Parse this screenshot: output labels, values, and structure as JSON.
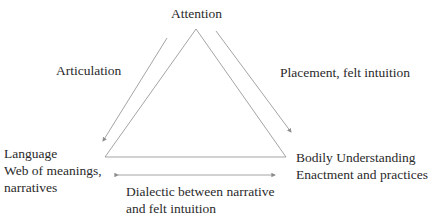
{
  "diagram": {
    "nodes": {
      "top": {
        "label": "Attention"
      },
      "left": {
        "lines": [
          "Language",
          "Web of meanings,",
          "narratives"
        ]
      },
      "right": {
        "lines": [
          "Bodily Understanding",
          "Enactment and practices"
        ]
      }
    },
    "edges": {
      "left_arrow": {
        "label": "Articulation",
        "direction": "top-to-left"
      },
      "right_arrow": {
        "label": "Placement, felt intuition",
        "direction": "top-to-right"
      },
      "bottom_arrow": {
        "lines": [
          "Dialectic between narrative",
          "and felt intuition"
        ],
        "direction": "bidirectional"
      }
    },
    "colors": {
      "line": "#8c8c8c",
      "text": "#2a2a2a"
    }
  }
}
